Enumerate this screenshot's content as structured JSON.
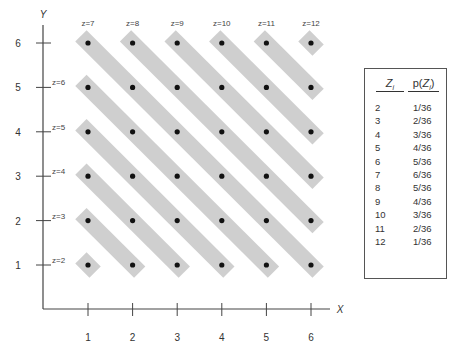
{
  "chart_data": {
    "type": "scatter",
    "title": "",
    "xlabel": "X",
    "ylabel": "Y",
    "x_ticks": [
      1,
      2,
      3,
      4,
      5,
      6
    ],
    "y_ticks": [
      1,
      2,
      3,
      4,
      5,
      6
    ],
    "points": "all (x,y) pairs with x,y in 1..6 (36 points)",
    "groups": [
      {
        "label": "z=2",
        "sum": 2
      },
      {
        "label": "z=3",
        "sum": 3
      },
      {
        "label": "z=4",
        "sum": 4
      },
      {
        "label": "z=5",
        "sum": 5
      },
      {
        "label": "z=6",
        "sum": 6
      },
      {
        "label": "z=7",
        "sum": 7
      },
      {
        "label": "z=8",
        "sum": 8
      },
      {
        "label": "z=9",
        "sum": 9
      },
      {
        "label": "z=10",
        "sum": 10
      },
      {
        "label": "z=11",
        "sum": 11
      },
      {
        "label": "z=12",
        "sum": 12
      }
    ],
    "table": {
      "headers": [
        "Zi",
        "p(Zi)"
      ],
      "rows": [
        [
          "2",
          "1/36"
        ],
        [
          "3",
          "2/36"
        ],
        [
          "4",
          "3/36"
        ],
        [
          "5",
          "4/36"
        ],
        [
          "6",
          "5/36"
        ],
        [
          "7",
          "6/36"
        ],
        [
          "8",
          "5/36"
        ],
        [
          "9",
          "4/36"
        ],
        [
          "10",
          "3/36"
        ],
        [
          "11",
          "2/36"
        ],
        [
          "12",
          "1/36"
        ]
      ]
    }
  },
  "axes": {
    "x_label": "X",
    "y_label": "Y",
    "x_ticks": [
      "1",
      "2",
      "3",
      "4",
      "5",
      "6"
    ],
    "y_ticks": [
      "1",
      "2",
      "3",
      "4",
      "5",
      "6"
    ]
  },
  "labels": {
    "left": [
      "z=2",
      "z=3",
      "z=4",
      "z=5",
      "z=6"
    ],
    "top": [
      "z=7",
      "z=8",
      "z=9",
      "z=10",
      "z=11",
      "z=12"
    ]
  },
  "table": {
    "header_z": "Zi",
    "header_p": "p(Zi)",
    "rows": [
      {
        "z": "2",
        "p": "1/36"
      },
      {
        "z": "3",
        "p": "2/36"
      },
      {
        "z": "4",
        "p": "3/36"
      },
      {
        "z": "5",
        "p": "4/36"
      },
      {
        "z": "6",
        "p": "5/36"
      },
      {
        "z": "7",
        "p": "6/36"
      },
      {
        "z": "8",
        "p": "5/36"
      },
      {
        "z": "9",
        "p": "4/36"
      },
      {
        "z": "10",
        "p": "3/36"
      },
      {
        "z": "11",
        "p": "2/36"
      },
      {
        "z": "12",
        "p": "1/36"
      }
    ]
  },
  "colors": {
    "band": "#cfcfcf",
    "axis": "#444444",
    "dot": "#111111"
  }
}
